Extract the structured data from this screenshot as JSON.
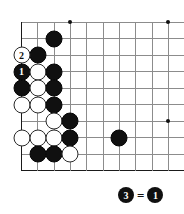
{
  "diagram": {
    "type": "go-board-corner",
    "board": {
      "left_px": 21.5,
      "top_px": 22,
      "col_spacing": 16.33,
      "row_spacing": 16.5,
      "cols": 10,
      "rows": 10,
      "edges": {
        "left": true,
        "top": false,
        "right": false,
        "bottom": true
      },
      "line_color": "#8c8c8c",
      "edge_color": "#1a1a1a"
    },
    "star_points": [
      {
        "col": 3,
        "row": 0
      },
      {
        "col": 9,
        "row": 0
      },
      {
        "col": 3,
        "row": 6
      },
      {
        "col": 9,
        "row": 6
      }
    ],
    "stones": [
      {
        "col": 2,
        "row": 1,
        "color": "black",
        "label": ""
      },
      {
        "col": 1,
        "row": 2,
        "color": "black",
        "label": ""
      },
      {
        "col": 0,
        "row": 2,
        "color": "white",
        "label": "2"
      },
      {
        "col": 0,
        "row": 3,
        "color": "black",
        "label": "1"
      },
      {
        "col": 1,
        "row": 3,
        "color": "white",
        "label": ""
      },
      {
        "col": 2,
        "row": 3,
        "color": "black",
        "label": ""
      },
      {
        "col": 0,
        "row": 4,
        "color": "black",
        "label": ""
      },
      {
        "col": 1,
        "row": 4,
        "color": "white",
        "label": ""
      },
      {
        "col": 2,
        "row": 4,
        "color": "black",
        "label": ""
      },
      {
        "col": 0,
        "row": 5,
        "color": "white",
        "label": ""
      },
      {
        "col": 1,
        "row": 5,
        "color": "white",
        "label": ""
      },
      {
        "col": 2,
        "row": 5,
        "color": "black",
        "label": ""
      },
      {
        "col": 2,
        "row": 6,
        "color": "white",
        "label": ""
      },
      {
        "col": 3,
        "row": 6,
        "color": "black",
        "label": ""
      },
      {
        "col": 0,
        "row": 7,
        "color": "white",
        "label": ""
      },
      {
        "col": 1,
        "row": 7,
        "color": "white",
        "label": ""
      },
      {
        "col": 2,
        "row": 7,
        "color": "white",
        "label": ""
      },
      {
        "col": 3,
        "row": 7,
        "color": "black",
        "label": ""
      },
      {
        "col": 6,
        "row": 7,
        "color": "black",
        "label": ""
      },
      {
        "col": 1,
        "row": 8,
        "color": "black",
        "label": ""
      },
      {
        "col": 2,
        "row": 8,
        "color": "black",
        "label": ""
      },
      {
        "col": 3,
        "row": 8,
        "color": "white",
        "label": ""
      }
    ]
  },
  "legend": {
    "move_label": "3",
    "equals": "=",
    "target_label": "1"
  }
}
